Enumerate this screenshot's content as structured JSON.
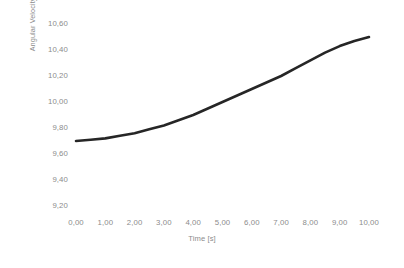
{
  "chart_data": {
    "type": "line",
    "title": "",
    "xlabel": "Time [s]",
    "ylabel": "Angular Velocity [deg/s]",
    "xlim": [
      0,
      10
    ],
    "ylim": [
      9.2,
      10.6
    ],
    "grid": false,
    "legend": false,
    "legend_position": "none",
    "x_tick_labels": [
      "0,00",
      "1,00",
      "2,00",
      "3,00",
      "4,00",
      "5,00",
      "6,00",
      "7,00",
      "8,00",
      "9,00",
      "10,00"
    ],
    "y_tick_labels": [
      "9,20",
      "9,40",
      "9,60",
      "9,80",
      "10,00",
      "10,20",
      "10,40",
      "10,60"
    ],
    "x_ticks": [
      0,
      1,
      2,
      3,
      4,
      5,
      6,
      7,
      8,
      9,
      10
    ],
    "y_ticks": [
      9.2,
      9.4,
      9.6,
      9.8,
      10.0,
      10.2,
      10.4,
      10.6
    ],
    "series": [
      {
        "name": "Angular Velocity",
        "color": "#262626",
        "line_width": 2.6,
        "x": [
          0.0,
          0.5,
          1.0,
          1.5,
          2.0,
          2.5,
          3.0,
          3.5,
          4.0,
          4.5,
          5.0,
          5.5,
          6.0,
          6.5,
          7.0,
          7.5,
          8.0,
          8.5,
          9.0,
          9.5,
          10.0
        ],
        "values": [
          9.7,
          9.71,
          9.72,
          9.74,
          9.76,
          9.79,
          9.82,
          9.86,
          9.9,
          9.95,
          10.0,
          10.05,
          10.1,
          10.15,
          10.2,
          10.26,
          10.32,
          10.38,
          10.43,
          10.47,
          10.5
        ]
      }
    ]
  }
}
